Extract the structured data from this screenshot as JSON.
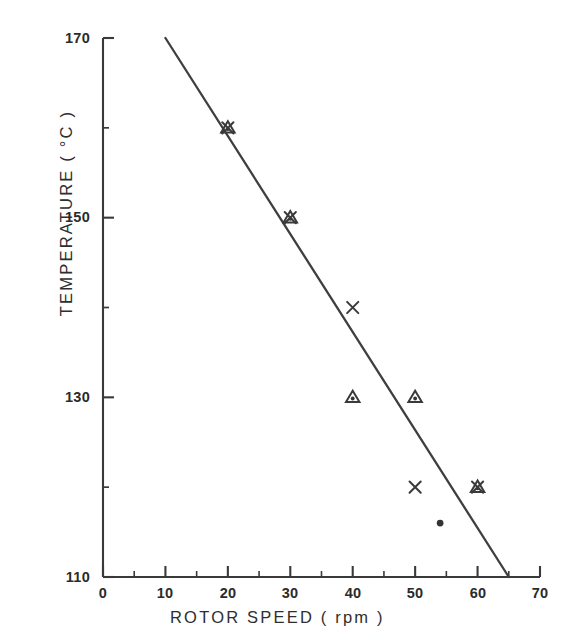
{
  "chart_data": {
    "type": "scatter",
    "title": "",
    "xlabel": "ROTOR  SPEED   ( rpm )",
    "ylabel": "TEMPERATURE   ( °C )",
    "xlim": [
      0,
      70
    ],
    "ylim": [
      110,
      170
    ],
    "xticks": [
      0,
      10,
      20,
      30,
      40,
      50,
      60,
      70
    ],
    "yticks": [
      110,
      130,
      150,
      170
    ],
    "xtick_labels": [
      "0",
      "10",
      "20",
      "30",
      "40",
      "50",
      "60",
      "70"
    ],
    "ytick_labels": [
      "110",
      "130",
      "150",
      "170"
    ],
    "y_minor_ticks": [
      120,
      140,
      160
    ],
    "grid": false,
    "legend": null,
    "legend_position": "none",
    "series": [
      {
        "name": "triangle-with-dot",
        "marker": "triangle-dot",
        "points": [
          {
            "x": 20,
            "y": 160
          },
          {
            "x": 30,
            "y": 150
          },
          {
            "x": 40,
            "y": 130
          },
          {
            "x": 50,
            "y": 130
          },
          {
            "x": 60,
            "y": 120
          }
        ]
      },
      {
        "name": "cross",
        "marker": "x",
        "points": [
          {
            "x": 20,
            "y": 160
          },
          {
            "x": 30,
            "y": 150
          },
          {
            "x": 40,
            "y": 140
          },
          {
            "x": 50,
            "y": 120
          },
          {
            "x": 60,
            "y": 120
          }
        ]
      },
      {
        "name": "filled-circle",
        "marker": "circle",
        "points": [
          {
            "x": 54,
            "y": 116
          }
        ]
      }
    ],
    "trend_line": {
      "name": "fitted-line",
      "x_start": 10,
      "y_start": 170,
      "x_end": 65,
      "y_end": 110
    }
  },
  "axes": {
    "y_axis_name": "temperature-axis",
    "x_axis_name": "rotor-speed-axis"
  }
}
